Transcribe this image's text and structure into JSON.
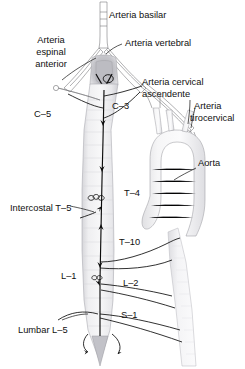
{
  "figure": {
    "language": "es",
    "background_color": "#ffffff",
    "width": 245,
    "height": 369
  },
  "labels": {
    "arteria_basilar": "Arteria basilar",
    "arteria_espinal_anterior": "Arteria\nespinal\nanterior",
    "arteria_espinal_anterior_l1": "Arteria",
    "arteria_espinal_anterior_l2": "espinal",
    "arteria_espinal_anterior_l3": "anterior",
    "arteria_vertebral": "Arteria vertebral",
    "arteria_cervical_ascendente_l1": "Arteria cervical",
    "arteria_cervical_ascendente_l2": "ascendente",
    "arteria_tirocervical_l1": "Arteria",
    "arteria_tirocervical_l2": "tirocervical",
    "aorta": "Aorta",
    "c5": "C–5",
    "c3": "C–3",
    "t4": "T–4",
    "intercostal_t5": "Intercostal T–5",
    "t10": "T–10",
    "l1": "L–1",
    "l2": "L–2",
    "s1": "S–1",
    "lumbar_l5": "Lumbar L–5"
  },
  "colors": {
    "label_text": "#101010",
    "leader_line": "#101010",
    "vessel_outline": "#6e6e72",
    "cord_fill_light": "#f2f2f3",
    "cord_fill_mid": "#e2e2e4",
    "cord_fill_dark": "#c9c9cd",
    "aorta_fill": "#f0f0f1",
    "artery_black": "#0d0d0d",
    "brainstem_shadow": "#b9b9be"
  },
  "structures": [
    {
      "name": "basilar-artery",
      "label_key": "arteria_basilar"
    },
    {
      "name": "anterior-spinal-artery",
      "label_key": "arteria_espinal_anterior"
    },
    {
      "name": "vertebral-artery",
      "label_key": "arteria_vertebral"
    },
    {
      "name": "ascending-cervical-artery",
      "label_key": "arteria_cervical_ascendente_l1"
    },
    {
      "name": "thyrocervical-trunk",
      "label_key": "arteria_tirocervical_l1"
    },
    {
      "name": "aorta",
      "label_key": "aorta"
    }
  ],
  "segment_markers": [
    {
      "name": "segment-c5",
      "label_key": "c5",
      "level": "C-5"
    },
    {
      "name": "segment-c3",
      "label_key": "c3",
      "level": "C-3"
    },
    {
      "name": "segment-t4",
      "label_key": "t4",
      "level": "T-4"
    },
    {
      "name": "segment-intercostal-t5",
      "label_key": "intercostal_t5",
      "level": "T-5"
    },
    {
      "name": "segment-t10",
      "label_key": "t10",
      "level": "T-10"
    },
    {
      "name": "segment-l1",
      "label_key": "l1",
      "level": "L-1"
    },
    {
      "name": "segment-l2",
      "label_key": "l2",
      "level": "L-2"
    },
    {
      "name": "segment-s1",
      "label_key": "s1",
      "level": "S-1"
    },
    {
      "name": "segment-lumbar-l5",
      "label_key": "lumbar_l5",
      "level": "L-5"
    }
  ]
}
